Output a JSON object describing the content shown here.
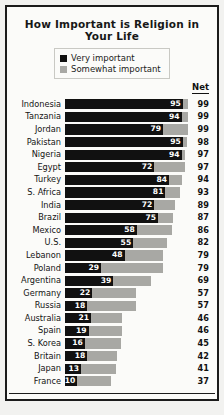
{
  "chart_data": {
    "type": "bar",
    "title": "How Important is Religion in Your Life",
    "subtitle": "",
    "xlabel": "",
    "ylabel": "",
    "xlim": [
      0,
      100
    ],
    "grid": false,
    "orientation": "horizontal",
    "stacked": true,
    "legend_position": "top-center",
    "net_column_header": "Net",
    "categories": [
      "Indonesia",
      "Tanzania",
      "Jordan",
      "Pakistan",
      "Nigeria",
      "Egypt",
      "Turkey",
      "S. Africa",
      "India",
      "Brazil",
      "Mexico",
      "U.S.",
      "Lebanon",
      "Poland",
      "Argentina",
      "Germany",
      "Russia",
      "Australia",
      "Spain",
      "S. Korea",
      "Britain",
      "Japan",
      "France"
    ],
    "series": [
      {
        "name": "Very important",
        "color": "#111111",
        "values": [
          95,
          94,
          79,
          95,
          94,
          72,
          84,
          81,
          72,
          75,
          58,
          55,
          48,
          29,
          39,
          22,
          18,
          21,
          19,
          16,
          18,
          13,
          10
        ]
      },
      {
        "name": "Somewhat important",
        "color": "#a8a8a4",
        "values": [
          4,
          5,
          20,
          3,
          3,
          25,
          10,
          12,
          17,
          12,
          28,
          27,
          31,
          50,
          30,
          35,
          39,
          25,
          27,
          29,
          24,
          28,
          27
        ]
      }
    ],
    "net": [
      99,
      99,
      99,
      98,
      97,
      97,
      94,
      93,
      89,
      87,
      86,
      82,
      79,
      79,
      69,
      57,
      57,
      46,
      46,
      45,
      42,
      41,
      37
    ],
    "rows": [
      {
        "country": "Indonesia",
        "very": 95,
        "net": 99
      },
      {
        "country": "Tanzania",
        "very": 94,
        "net": 99
      },
      {
        "country": "Jordan",
        "very": 79,
        "net": 99
      },
      {
        "country": "Pakistan",
        "very": 95,
        "net": 98
      },
      {
        "country": "Nigeria",
        "very": 94,
        "net": 97
      },
      {
        "country": "Egypt",
        "very": 72,
        "net": 97
      },
      {
        "country": "Turkey",
        "very": 84,
        "net": 94
      },
      {
        "country": "S. Africa",
        "very": 81,
        "net": 93
      },
      {
        "country": "India",
        "very": 72,
        "net": 89
      },
      {
        "country": "Brazil",
        "very": 75,
        "net": 87
      },
      {
        "country": "Mexico",
        "very": 58,
        "net": 86
      },
      {
        "country": "U.S.",
        "very": 55,
        "net": 82
      },
      {
        "country": "Lebanon",
        "very": 48,
        "net": 79
      },
      {
        "country": "Poland",
        "very": 29,
        "net": 79
      },
      {
        "country": "Argentina",
        "very": 39,
        "net": 69
      },
      {
        "country": "Germany",
        "very": 22,
        "net": 57
      },
      {
        "country": "Russia",
        "very": 18,
        "net": 57
      },
      {
        "country": "Australia",
        "very": 21,
        "net": 46
      },
      {
        "country": "Spain",
        "very": 19,
        "net": 46
      },
      {
        "country": "S. Korea",
        "very": 16,
        "net": 45
      },
      {
        "country": "Britain",
        "very": 18,
        "net": 42
      },
      {
        "country": "Japan",
        "very": 13,
        "net": 41
      },
      {
        "country": "France",
        "very": 10,
        "net": 37
      }
    ]
  },
  "legend": {
    "items": [
      {
        "label": "Very important",
        "color": "#111111"
      },
      {
        "label": "Somewhat important",
        "color": "#a8a8a4"
      }
    ]
  },
  "footnote": {
    "text": "Question 83."
  }
}
